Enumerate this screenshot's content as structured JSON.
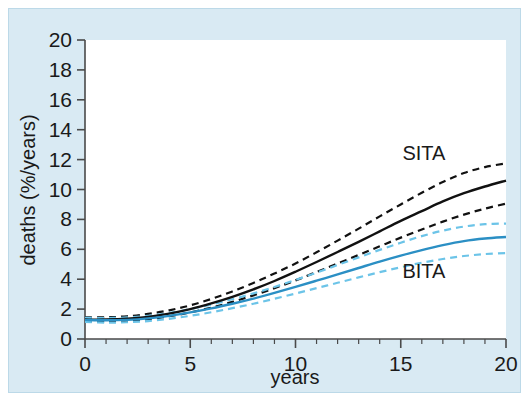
{
  "figure": {
    "background_color": "#d9eaf3",
    "border_color": "#bcd9e8",
    "plot_background_color": "#ffffff"
  },
  "chart_data": {
    "type": "line",
    "title": "",
    "xlabel": "years",
    "ylabel": "deaths (%/years)",
    "xlim": [
      0,
      20
    ],
    "ylim": [
      0,
      20
    ],
    "xticks": [
      0,
      5,
      10,
      15,
      20
    ],
    "xtick_labels": [
      "0",
      "5",
      "10",
      "15",
      "20"
    ],
    "x_minor_tick_step": 1,
    "yticks": [
      0,
      2,
      4,
      6,
      8,
      10,
      12,
      14,
      16,
      18,
      20
    ],
    "ytick_labels": [
      "0",
      "2",
      "4",
      "6",
      "8",
      "10",
      "12",
      "14",
      "16",
      "18",
      "20"
    ],
    "grid": false,
    "legend_position": "inline-annotation",
    "x": [
      0,
      1,
      2,
      3,
      4,
      5,
      6,
      7,
      8,
      9,
      10,
      11,
      12,
      13,
      14,
      15,
      16,
      17,
      18,
      19,
      20
    ],
    "series": [
      {
        "name": "SITA",
        "color": "#111111",
        "style": "solid",
        "values": [
          1.3,
          1.3,
          1.35,
          1.48,
          1.7,
          2.0,
          2.38,
          2.82,
          3.32,
          3.88,
          4.5,
          5.15,
          5.82,
          6.5,
          7.2,
          7.9,
          8.55,
          9.2,
          9.75,
          10.2,
          10.6
        ]
      },
      {
        "name": "SITA upper CI",
        "color": "#111111",
        "style": "dashed",
        "values": [
          1.45,
          1.45,
          1.52,
          1.68,
          1.92,
          2.25,
          2.68,
          3.18,
          3.75,
          4.38,
          5.05,
          5.8,
          6.58,
          7.38,
          8.2,
          9.0,
          9.78,
          10.5,
          11.1,
          11.5,
          11.75
        ]
      },
      {
        "name": "SITA lower CI",
        "color": "#111111",
        "style": "dashed",
        "values": [
          1.18,
          1.18,
          1.22,
          1.33,
          1.52,
          1.78,
          2.1,
          2.48,
          2.92,
          3.4,
          3.92,
          4.48,
          5.05,
          5.62,
          6.2,
          6.78,
          7.32,
          7.85,
          8.32,
          8.72,
          9.05
        ]
      },
      {
        "name": "BITA",
        "color": "#2b8fc4",
        "style": "solid",
        "values": [
          1.28,
          1.25,
          1.28,
          1.38,
          1.55,
          1.78,
          2.05,
          2.36,
          2.7,
          3.08,
          3.48,
          3.9,
          4.32,
          4.75,
          5.18,
          5.58,
          5.95,
          6.28,
          6.55,
          6.72,
          6.82
        ]
      },
      {
        "name": "BITA upper CI",
        "color": "#6cc4e8",
        "style": "dashed",
        "values": [
          1.42,
          1.4,
          1.44,
          1.55,
          1.74,
          2.0,
          2.3,
          2.66,
          3.05,
          3.48,
          3.95,
          4.44,
          4.95,
          5.46,
          5.96,
          6.44,
          6.88,
          7.25,
          7.52,
          7.68,
          7.72
        ]
      },
      {
        "name": "BITA lower CI",
        "color": "#6cc4e8",
        "style": "dashed",
        "values": [
          1.14,
          1.1,
          1.12,
          1.2,
          1.35,
          1.55,
          1.79,
          2.06,
          2.36,
          2.69,
          3.04,
          3.4,
          3.76,
          4.12,
          4.47,
          4.8,
          5.1,
          5.35,
          5.55,
          5.68,
          5.75
        ]
      }
    ],
    "annotations": [
      {
        "text": "SITA",
        "x": 16.1,
        "y": 12.0
      },
      {
        "text": "BITA",
        "x": 16.1,
        "y": 4.1
      }
    ]
  }
}
